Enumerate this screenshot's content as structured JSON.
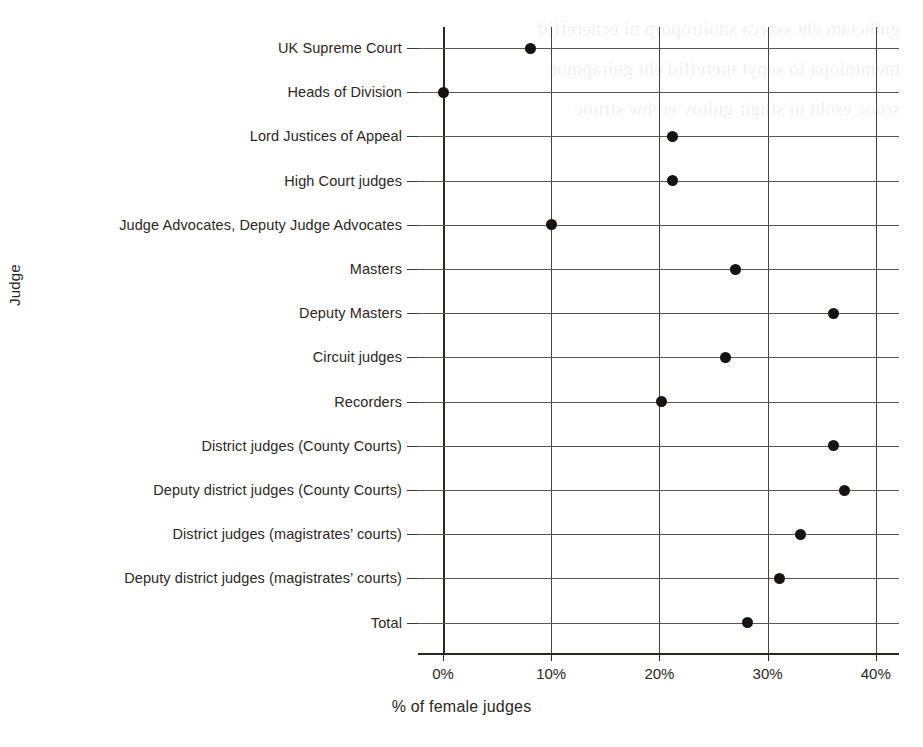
{
  "chart_data": {
    "type": "scatter",
    "title": "",
    "xlabel": "% of female judges",
    "ylabel": "Judge",
    "xlim": [
      0,
      40
    ],
    "xticks": [
      0,
      10,
      20,
      30,
      40
    ],
    "xtick_labels": [
      "0%",
      "10%",
      "20%",
      "30%",
      "40%"
    ],
    "grid": "vertical gridlines at each x tick, horizontal rule at each category",
    "legend": "none",
    "marker": "filled black circle",
    "categories": [
      "UK Supreme Court",
      "Heads of Division",
      "Lord Justices of Appeal",
      "High Court judges",
      "Judge Advocates, Deputy Judge Advocates",
      "Masters",
      "Deputy Masters",
      "Circuit judges",
      "Recorders",
      "District judges (County Courts)",
      "Deputy district judges (County Courts)",
      "District judges (magistrates’ courts)",
      "Deputy district judges (magistrates’ courts)",
      "Total"
    ],
    "values": [
      8.1,
      0.0,
      21.2,
      21.2,
      10.0,
      27.0,
      36.1,
      26.1,
      20.2,
      36.1,
      37.1,
      33.0,
      31.1,
      28.1
    ]
  },
  "style": {
    "dot_color": "#15120f",
    "grid_color": "#474240",
    "row_line_color": "#5b5653",
    "axis_color": "#2a2725",
    "text_color": "#2b2725",
    "background": "#ffffff"
  },
  "background_bleed": [
    "gnihctam eht ssorca snoitroporp ni ecnereffid",
    "tnemtniopa fo sepyt tnereffid eht gnirapmoc",
    "sruoc esoht ni sthgir gnitov erehw struoc"
  ]
}
